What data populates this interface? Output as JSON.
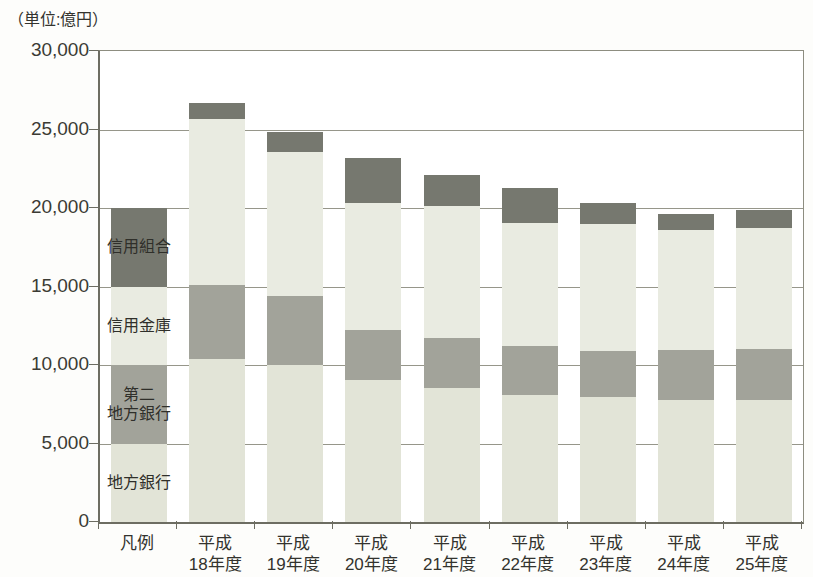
{
  "chart_data": {
    "type": "bar",
    "subtype": "stacked-bar",
    "title": "",
    "unit_caption": "（単位:億円）",
    "xlabel": "",
    "ylabel": "",
    "ylim": [
      0,
      30000
    ],
    "ytick_values": [
      0,
      5000,
      10000,
      15000,
      20000,
      25000,
      30000
    ],
    "ytick_labels": [
      "0",
      "5,000",
      "10,000",
      "15,000",
      "20,000",
      "25,000",
      "30,000"
    ],
    "grid": true,
    "grid_axis": "y",
    "legend_position": "in-plot-first-column",
    "categories": [
      "凡例",
      "平成\n18年度",
      "平成\n19年度",
      "平成\n20年度",
      "平成\n21年度",
      "平成\n22年度",
      "平成\n23年度",
      "平成\n24年度",
      "平成\n25年度"
    ],
    "series": [
      {
        "name": "地方銀行",
        "key": "chiho",
        "color": "#e2e4d7",
        "values": [
          5000,
          10400,
          10000,
          9050,
          8550,
          8100,
          7950,
          7800,
          7750
        ]
      },
      {
        "name": "第二\n地方銀行",
        "key": "daini",
        "color": "#a2a39a",
        "values": [
          5000,
          4700,
          4400,
          3150,
          3200,
          3100,
          2950,
          3150,
          3250
        ]
      },
      {
        "name": "信用金庫",
        "key": "shinkin",
        "color": "#e9ebe1",
        "values": [
          5000,
          10600,
          9150,
          8150,
          8400,
          7850,
          8100,
          7650,
          7700
        ]
      },
      {
        "name": "信用組合",
        "key": "shinkumi",
        "color": "#76786f",
        "values": [
          5000,
          1000,
          1300,
          2850,
          1950,
          2200,
          1350,
          1000,
          1200
        ]
      }
    ],
    "totals": [
      20000,
      26700,
      24850,
      23200,
      22100,
      21250,
      20350,
      19600,
      19900
    ]
  },
  "style": {
    "axis_color": "#6d6d62",
    "grid_color": "#96968a",
    "text_color": "#33332e",
    "plot_background": "#ffffff",
    "figure_background": "#fdfdfb"
  }
}
